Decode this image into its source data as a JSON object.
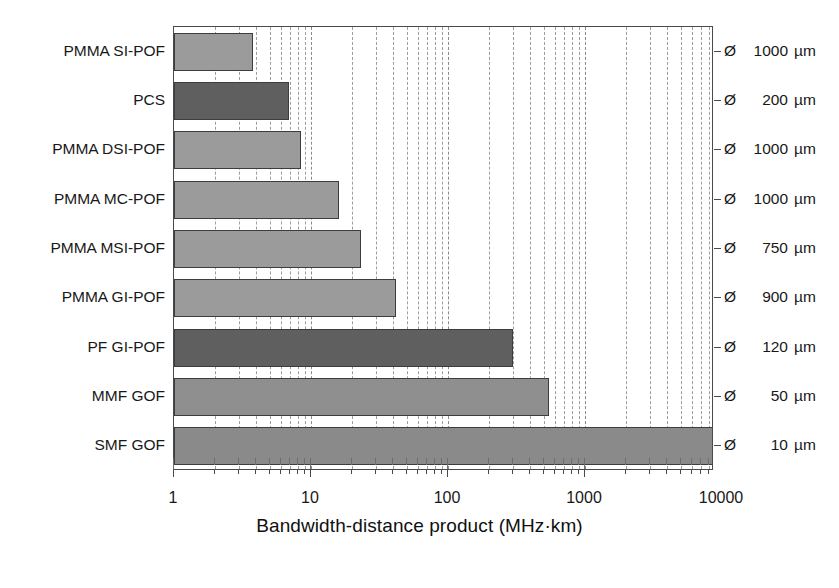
{
  "chart_data": {
    "type": "bar",
    "orientation": "horizontal",
    "title": "",
    "xlabel": "Bandwidth-distance product (MHz·km)",
    "ylabel": "",
    "xscale": "log",
    "xlim": [
      1,
      20000
    ],
    "grid": true,
    "legend": "none",
    "xticks": [
      1,
      10,
      100,
      1000,
      10000
    ],
    "xticklabels": [
      "1",
      "10",
      "100",
      "1000",
      "10000"
    ],
    "categories": [
      "PMMA SI-POF",
      "PCS",
      "PMMA DSI-POF",
      "PMMA MC-POF",
      "PMMA MSI-POF",
      "PMMA GI-POF",
      "PF GI-POF",
      "MMF GOF",
      "SMF GOF"
    ],
    "values": [
      3.8,
      6.9,
      8.5,
      16,
      23,
      42,
      300,
      550,
      20000
    ],
    "annotations": [
      "Ø 1000 µm",
      "Ø  200 µm",
      "Ø 1000 µm",
      "Ø 1000 µm",
      "Ø  750 µm",
      "Ø  900 µm",
      "Ø  120 µm",
      "Ø   50 µm",
      "Ø   10 µm"
    ],
    "bar_colors": [
      "#9b9b9b",
      "#5f5f5f",
      "#9b9b9b",
      "#9b9b9b",
      "#9b9b9b",
      "#9b9b9b",
      "#5f5f5f",
      "#8f8f8f",
      "#8a8a8a"
    ]
  },
  "right_labels": [
    {
      "symbol": "Ø",
      "value": "1000",
      "unit": "µm"
    },
    {
      "symbol": "Ø",
      "value": "200",
      "unit": "µm"
    },
    {
      "symbol": "Ø",
      "value": "1000",
      "unit": "µm"
    },
    {
      "symbol": "Ø",
      "value": "1000",
      "unit": "µm"
    },
    {
      "symbol": "Ø",
      "value": "750",
      "unit": "µm"
    },
    {
      "symbol": "Ø",
      "value": "900",
      "unit": "µm"
    },
    {
      "symbol": "Ø",
      "value": "120",
      "unit": "µm"
    },
    {
      "symbol": "Ø",
      "value": "50",
      "unit": "µm"
    },
    {
      "symbol": "Ø",
      "value": "10",
      "unit": "µm"
    }
  ],
  "colors": {
    "bar_light": "#9b9b9b",
    "bar_dark": "#5f5f5f",
    "bar_edge": "#3d3d3d",
    "axis": "#4a4a4a",
    "grid": "#9d9d9d",
    "text": "#181818",
    "background": "#ffffff"
  }
}
